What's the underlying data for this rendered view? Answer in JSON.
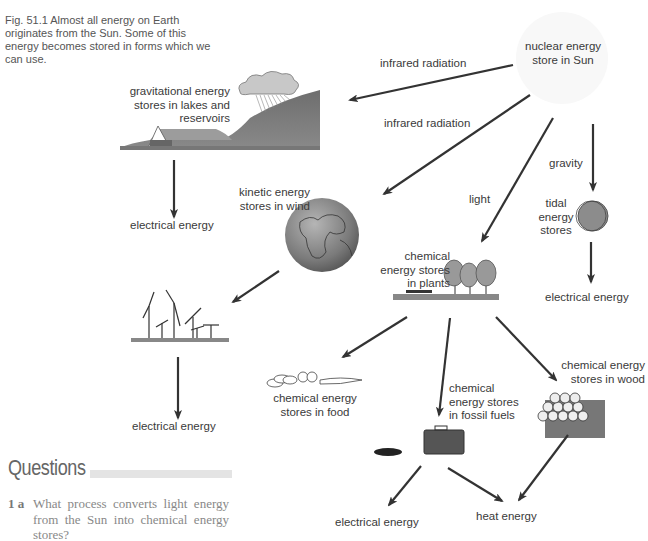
{
  "figure": {
    "caption": "Fig. 51.1  Almost all energy on Earth originates from the Sun. Some of this energy becomes stored in forms which we can use."
  },
  "nodes": {
    "sun": {
      "line1": "nuclear energy",
      "line2": "store in Sun"
    },
    "lakes": {
      "line1": "gravitational energy",
      "line2": "stores in lakes and",
      "line3": "reservoirs"
    },
    "wind": {
      "line1": "kinetic energy",
      "line2": "stores in wind"
    },
    "tidal": {
      "line1": "tidal",
      "line2": "energy",
      "line3": "stores"
    },
    "plants": {
      "line1": "chemical",
      "line2": "energy stores",
      "line3": "in plants"
    },
    "food": {
      "line1": "chemical energy",
      "line2": "stores in food"
    },
    "fossil": {
      "line1": "chemical",
      "line2": "energy stores",
      "line3": "in fossil fuels"
    },
    "wood": {
      "line1": "chemical energy",
      "line2": "stores in wood"
    },
    "elec_lakes": "electrical energy",
    "elec_wind": "electrical energy",
    "elec_tidal": "electrical energy",
    "elec_fossil": "electrical energy",
    "heat": "heat energy"
  },
  "arrow_labels": {
    "ir1": "infrared radiation",
    "ir2": "infrared radiation",
    "light": "light",
    "gravity": "gravity"
  },
  "questions": {
    "heading": "Questions",
    "items": [
      {
        "number": "1 a",
        "text": "What process converts light energy from the Sun into chemical energy stores?"
      }
    ]
  }
}
